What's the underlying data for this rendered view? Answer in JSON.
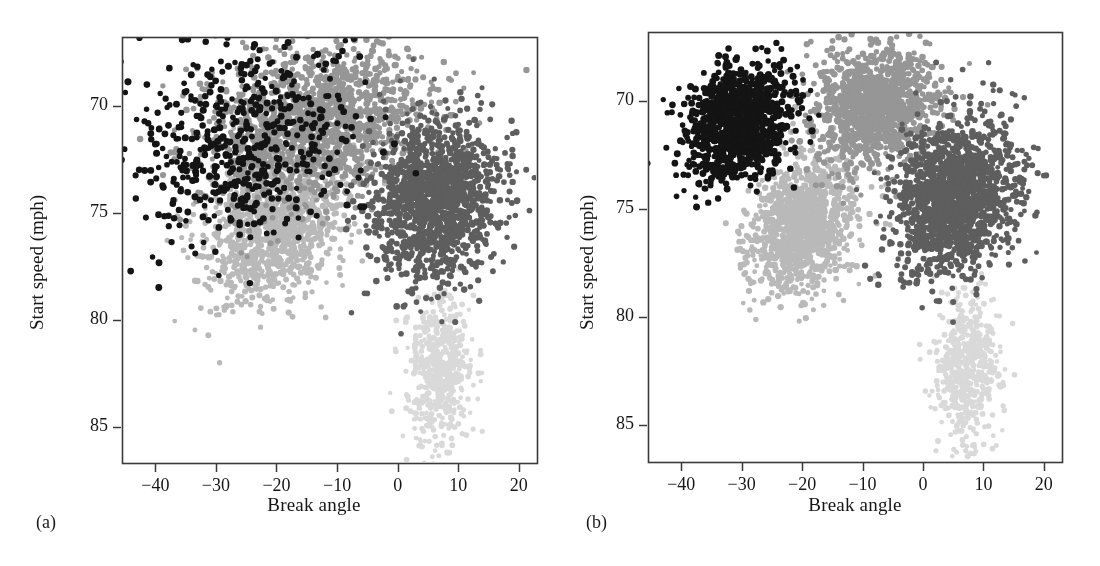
{
  "figure": {
    "width": 1100,
    "height": 566,
    "background": "#ffffff",
    "panels": [
      {
        "tag": "(a)",
        "name": "panel-a"
      },
      {
        "tag": "(b)",
        "name": "panel-b"
      }
    ]
  },
  "axes": {
    "xlabel": "Break angle",
    "ylabel": "Start speed (mph)",
    "xticks": [
      "−40",
      "−30",
      "−20",
      "−10",
      "0",
      "10",
      "20"
    ],
    "yticks": [
      "85",
      "80",
      "75",
      "70"
    ]
  },
  "colors": {
    "cluster_black": "#141414",
    "cluster_medium_gray": "#969696",
    "cluster_dark_gray": "#5e5e5e",
    "cluster_light_gray": "#b9b9b9",
    "cluster_very_light_gray": "#d9d9d9",
    "frame": "#3a3a3a",
    "text": "#161616"
  },
  "chart_data": {
    "type": "scatter",
    "title": "",
    "xlabel": "Break angle",
    "ylabel": "Start speed (mph)",
    "xlim": [
      -45.5,
      23.0
    ],
    "ylim": [
      68.3,
      88.2
    ],
    "xticks": [
      -40,
      -30,
      -20,
      -10,
      0,
      10,
      20
    ],
    "yticks": [
      70,
      75,
      80,
      85
    ],
    "grid": false,
    "legend": "none",
    "panels": [
      {
        "tag": "(a)",
        "caption": "(a)",
        "description": "Model-based clustering assignment with heavily overlapping, dispersed groups; black points scattered broadly across the other clusters.",
        "series": [
          {
            "name": "cluster-1-black",
            "color": "#141414",
            "n": 520,
            "seed": 1101,
            "shape": "blob",
            "mean_x": -26.0,
            "mean_y": 83.2,
            "sd_x": 9.5,
            "sd_y": 2.4,
            "rho": 0.18,
            "radius": 3.1
          },
          {
            "name": "cluster-2-medium-gray",
            "color": "#969696",
            "n": 1500,
            "seed": 2202,
            "shape": "blob",
            "mean_x": -13.0,
            "mean_y": 84.2,
            "sd_x": 9.0,
            "sd_y": 1.75,
            "rho": 0.2,
            "radius": 2.9
          },
          {
            "name": "cluster-3-dark-gray",
            "color": "#5e5e5e",
            "n": 1450,
            "seed": 3303,
            "shape": "blob",
            "mean_x": 6.2,
            "mean_y": 80.6,
            "sd_x": 5.2,
            "sd_y": 1.9,
            "rho": 0.12,
            "radius": 2.9
          },
          {
            "name": "cluster-4-light-gray",
            "color": "#b9b9b9",
            "n": 1150,
            "seed": 4404,
            "shape": "blob",
            "mean_x": -20.5,
            "mean_y": 79.4,
            "sd_x": 5.6,
            "sd_y": 1.7,
            "rho": 0.25,
            "radius": 2.8
          },
          {
            "name": "cluster-5-very-light-gray",
            "color": "#d9d9d9",
            "n": 560,
            "seed": 5505,
            "shape": "blob",
            "mean_x": 7.0,
            "mean_y": 72.6,
            "sd_x": 2.7,
            "sd_y": 1.7,
            "rho": 0.05,
            "radius": 2.6
          }
        ]
      },
      {
        "tag": "(b)",
        "caption": "(b)",
        "description": "Clean, well-separated cluster assignment: black upper-left, medium gray upper-center, dark gray right, light gray lower-center, very light gray bottom.",
        "series": [
          {
            "name": "cluster-1-black",
            "color": "#141414",
            "n": 1080,
            "seed": 6606,
            "shape": "blob",
            "mean_x": -30.5,
            "mean_y": 84.0,
            "sd_x": 4.3,
            "sd_y": 1.35,
            "rho": 0.18,
            "radius": 3.1
          },
          {
            "name": "cluster-2-medium-gray",
            "color": "#969696",
            "n": 1250,
            "seed": 7707,
            "shape": "blob",
            "mean_x": -8.0,
            "mean_y": 84.7,
            "sd_x": 5.0,
            "sd_y": 1.35,
            "rho": 0.15,
            "radius": 2.9
          },
          {
            "name": "cluster-3-dark-gray",
            "color": "#5e5e5e",
            "n": 1550,
            "seed": 8808,
            "shape": "blob",
            "mean_x": 5.6,
            "mean_y": 80.6,
            "sd_x": 5.1,
            "sd_y": 1.85,
            "rho": 0.18,
            "radius": 2.9
          },
          {
            "name": "cluster-4-light-gray",
            "color": "#b9b9b9",
            "n": 1180,
            "seed": 9909,
            "shape": "blob",
            "mean_x": -20.0,
            "mean_y": 79.3,
            "sd_x": 4.1,
            "sd_y": 1.55,
            "rho": 0.22,
            "radius": 2.8
          },
          {
            "name": "cluster-5-very-light-gray",
            "color": "#d9d9d9",
            "n": 580,
            "seed": 1212,
            "shape": "blob",
            "mean_x": 7.2,
            "mean_y": 72.6,
            "sd_x": 2.6,
            "sd_y": 1.7,
            "rho": 0.05,
            "radius": 2.6
          }
        ]
      }
    ]
  }
}
